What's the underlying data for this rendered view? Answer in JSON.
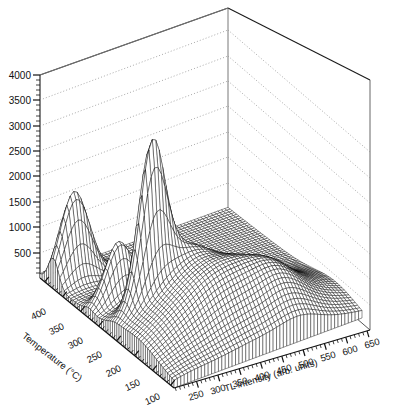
{
  "figure": {
    "kind": "3d-surface-mesh-plot",
    "background": "#ffffff",
    "line_color": "#000000",
    "grid_color": "#9a9a9a",
    "width": 395,
    "height": 406
  },
  "chart_data": {
    "type": "line",
    "render_style": "3d wireframe mesh surface (waterfall)",
    "title": "",
    "subtitle": "",
    "xlabel": "Temperature (°C)",
    "ylabel": "TL intensity (arb. units)",
    "zlabel": "",
    "grid": true,
    "legend": null,
    "legend_position": "none",
    "xlim": [
      50,
      425
    ],
    "ylim": [
      50,
      675
    ],
    "zlim": [
      0,
      4250
    ],
    "x_axis": {
      "name": "Temperature (°C)",
      "ticks": [
        400,
        350,
        300,
        250,
        200,
        150,
        100,
        50
      ],
      "tick_labels": [
        "400",
        "350",
        "300",
        "250",
        "200",
        "150",
        "100",
        "50"
      ],
      "direction": "descending-left-to-right",
      "minor_ticks_per_interval": 5
    },
    "y_axis": {
      "name": "TL intensity (arb. units)",
      "ticks": [
        250,
        300,
        350,
        400,
        450,
        500,
        550,
        600,
        650
      ],
      "tick_labels": [
        "250",
        "300",
        "350",
        "400",
        "450",
        "500",
        "550",
        "600",
        "650"
      ],
      "direction": "ascending-left-to-right",
      "minor_ticks_per_interval": 5
    },
    "z_axis": {
      "name": "",
      "ticks": [
        500,
        1000,
        1500,
        2000,
        2500,
        3000,
        3500,
        4000
      ],
      "tick_labels": [
        "500",
        "1000",
        "1500",
        "2000",
        "2500",
        "3000",
        "3500",
        "4000"
      ],
      "minor_ticks_per_interval": 5
    },
    "peaks": [
      {
        "label": "peak-1",
        "temperature": 365,
        "tl_intensity": 120,
        "height": 1680
      },
      {
        "label": "peak-2",
        "temperature": 270,
        "tl_intensity": 150,
        "height": 1150
      },
      {
        "label": "peak-3",
        "temperature": 205,
        "tl_intensity": 175,
        "height": 2700
      },
      {
        "label": "broad-ridge-shoulder",
        "temperature": 150,
        "tl_intensity": 300,
        "height": 900
      },
      {
        "label": "minor-bump",
        "temperature": 120,
        "tl_intensity": 470,
        "height": 320
      }
    ],
    "series": [
      {
        "name": "T=400",
        "values": [
          60,
          150,
          420,
          1050,
          1640,
          1180,
          520,
          230,
          120,
          80,
          60,
          50,
          45,
          40,
          35,
          30
        ]
      },
      {
        "name": "T=350",
        "values": [
          55,
          120,
          300,
          700,
          980,
          700,
          340,
          170,
          100,
          70,
          55,
          45,
          40,
          35,
          32,
          28
        ]
      },
      {
        "name": "T=300",
        "values": [
          50,
          110,
          260,
          560,
          760,
          900,
          1150,
          760,
          330,
          150,
          90,
          65,
          50,
          42,
          36,
          30
        ]
      },
      {
        "name": "T=250",
        "values": [
          60,
          180,
          520,
          1400,
          2320,
          2700,
          1900,
          980,
          480,
          260,
          160,
          110,
          80,
          60,
          48,
          38
        ]
      },
      {
        "name": "T=200",
        "values": [
          70,
          220,
          640,
          1250,
          1450,
          1180,
          880,
          640,
          470,
          360,
          290,
          240,
          200,
          170,
          140,
          110
        ]
      },
      {
        "name": "T=150",
        "values": [
          65,
          190,
          480,
          820,
          900,
          860,
          780,
          700,
          620,
          540,
          470,
          410,
          350,
          300,
          250,
          200
        ]
      },
      {
        "name": "T=100",
        "values": [
          55,
          150,
          330,
          520,
          600,
          610,
          580,
          560,
          540,
          520,
          480,
          430,
          380,
          330,
          280,
          230
        ]
      },
      {
        "name": "T=50",
        "values": [
          45,
          110,
          220,
          330,
          400,
          430,
          440,
          450,
          440,
          420,
          390,
          350,
          310,
          270,
          230,
          190
        ]
      }
    ]
  }
}
